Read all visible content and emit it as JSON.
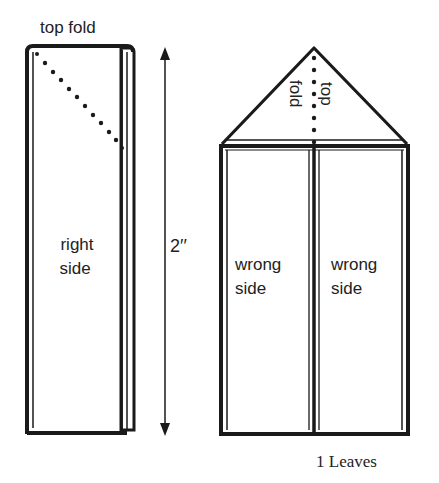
{
  "diagram": {
    "caption": "1 Leaves",
    "left_panel": {
      "title": "top fold",
      "label_line1": "right",
      "label_line2": "side"
    },
    "dimension": {
      "label": "2′′"
    },
    "right_panel": {
      "fold_label_line1": "top",
      "fold_label_line2": "fold",
      "left_label_line1": "wrong",
      "left_label_line2": "side",
      "right_label_line1": "wrong",
      "right_label_line2": "side"
    },
    "colors": {
      "ink": "#1a1a1a",
      "paper": "#ffffff"
    }
  }
}
